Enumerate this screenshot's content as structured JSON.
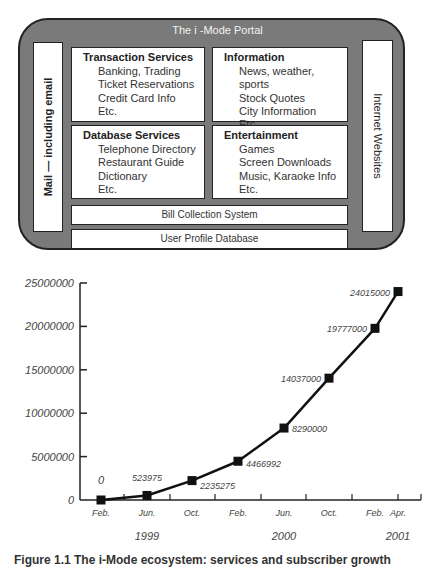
{
  "portal": {
    "title": "The i -Mode Portal",
    "left_bar": "Mail — including email",
    "right_bar": "Internet Websites",
    "services": [
      {
        "title": "Transaction Services",
        "items": [
          "Banking, Trading",
          "Ticket Reservations",
          "Credit Card Info",
          "Etc."
        ]
      },
      {
        "title": "Information",
        "items": [
          "News, weather, sports",
          "Stock Quotes",
          "City Information",
          "Etc."
        ]
      },
      {
        "title": "Database Services",
        "items": [
          "Telephone Directory",
          "Restaurant Guide",
          "Dictionary",
          "Etc."
        ]
      },
      {
        "title": "Entertainment",
        "items": [
          "Games",
          "Screen Downloads",
          "Music, Karaoke Info",
          "Etc."
        ]
      }
    ],
    "bill": "Bill Collection System",
    "profile": "User Profile Database"
  },
  "chart_data": {
    "type": "line",
    "title": "",
    "xlabel": "",
    "ylabel": "",
    "ylim": [
      0,
      25000000
    ],
    "yticks": [
      "0",
      "5000000",
      "10000000",
      "15000000",
      "20000000",
      "25000000"
    ],
    "x_tick_labels": [
      "Feb.",
      "Jun.",
      "Oct.",
      "Feb.",
      "Jun.",
      "Oct.",
      "Feb.",
      "Apr."
    ],
    "year_labels": [
      "1999",
      "2000",
      "2001"
    ],
    "grid": false,
    "x": [
      "Feb 1999",
      "Jun 1999",
      "Oct 1999",
      "Feb 2000",
      "Jun 2000",
      "Oct 2000",
      "Feb 2001",
      "Apr 2001"
    ],
    "values": [
      0,
      523975,
      2235275,
      4466992,
      8290000,
      14037000,
      19777000,
      24015000
    ],
    "labels": [
      "0",
      "523975",
      "2235275",
      "4466992",
      "8290000",
      "14037000",
      "19777000",
      "24015000"
    ]
  },
  "caption": "Figure 1.1   The i-Mode ecosystem: services and subscriber growth"
}
